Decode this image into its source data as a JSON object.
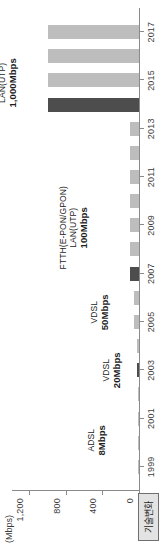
{
  "chart_data": {
    "type": "bar",
    "orientation": "vertical",
    "title": "",
    "xlabel": "",
    "ylabel": "",
    "unit_label": "(Mbps)",
    "grid": false,
    "xlim": [
      1998,
      2018
    ],
    "ylim": [
      0,
      1400
    ],
    "ytick_labels": [
      "0",
      "400",
      "800",
      "1,200"
    ],
    "ytick_values": [
      0,
      400,
      800,
      1200
    ],
    "xtick_labels": [
      "1999",
      "2001",
      "2003",
      "2005",
      "2007",
      "2009",
      "2011",
      "2013",
      "2015",
      "2017"
    ],
    "xtick_values": [
      1999,
      2001,
      2003,
      2005,
      2007,
      2009,
      2011,
      2013,
      2015,
      2017
    ],
    "x": [
      1999,
      2000,
      2001,
      2002,
      2003,
      2004,
      2005,
      2006,
      2007,
      2008,
      2009,
      2010,
      2011,
      2012,
      2013,
      2014,
      2015,
      2016,
      2017
    ],
    "values": [
      8,
      8,
      8,
      8,
      20,
      20,
      50,
      50,
      100,
      100,
      100,
      100,
      100,
      100,
      100,
      1000,
      1000,
      1000,
      1000
    ],
    "bar_colors": [
      "#bdbdbd",
      "#bdbdbd",
      "#bdbdbd",
      "#bdbdbd",
      "#4d4d4d",
      "#bdbdbd",
      "#bdbdbd",
      "#bdbdbd",
      "#4d4d4d",
      "#bdbdbd",
      "#bdbdbd",
      "#bdbdbd",
      "#bdbdbd",
      "#bdbdbd",
      "#bdbdbd",
      "#4d4d4d",
      "#bdbdbd",
      "#bdbdbd",
      "#bdbdbd"
    ],
    "series_name": "기술변화",
    "colors": {
      "bar_normal": "#bdbdbd",
      "bar_highlight": "#4d4d4d",
      "axis": "#8a8a8a",
      "text": "#3d3d3d",
      "legend_fill": "#e3e3e3",
      "legend_border": "#6f6f6f"
    },
    "annotations": [
      {
        "name": "ADSL",
        "value": "8Mbps",
        "at_year": 2000.1,
        "at_speed": 360
      },
      {
        "name": "VDSL",
        "value": "20Mbps",
        "at_year": 2003.0,
        "at_speed": 200
      },
      {
        "name": "VDSL",
        "value": "50Mbps",
        "at_year": 2005.4,
        "at_speed": 330
      },
      {
        "name": "FTTH(E-PON/GPON)\nLAN(UTP)",
        "value": "100Mbps",
        "at_year": 2008.9,
        "at_speed": 560
      },
      {
        "name": "FTTH(E-PON/GPON)\nLAN(UTP)",
        "value": "1,000Mbps",
        "at_year": 2014.9,
        "at_speed": 1330
      }
    ]
  },
  "legend": {
    "label": "기술변화"
  },
  "axis": {
    "unit": "(Mbps)"
  }
}
